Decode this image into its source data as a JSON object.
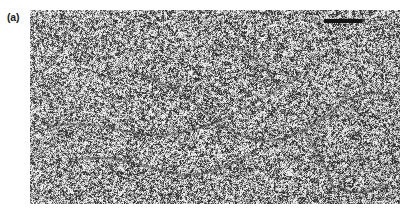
{
  "figure": {
    "kind": "electron-micrograph",
    "panel_label": "(a)",
    "caption_text": "",
    "background_color": "#ffffff"
  },
  "panel": {
    "name": "micrograph-panel",
    "x": 30,
    "y": 10,
    "width": 370,
    "height": 194,
    "mean_tone": "#c9c9c9",
    "grain_description": "fine high-contrast grayscale speckle (carbon support film)",
    "specimen_description": "faint dark branching thread-like filaments (DNA molecules) spread across the field",
    "grain": {
      "dark_color": "#2e2e2e",
      "mid_color": "#9a9a9a",
      "light_color": "#f0f0f0",
      "granule_size_px": 1.6,
      "density": 0.52,
      "seed": 20240517
    },
    "filaments": {
      "color": "#3a3a3a",
      "line_width_px": 1.4,
      "count": 11,
      "paths": [
        [
          [
            18,
            116
          ],
          [
            52,
            112
          ],
          [
            88,
            120
          ],
          [
            124,
            126
          ],
          [
            158,
            122
          ],
          [
            186,
            112
          ]
        ],
        [
          [
            186,
            112
          ],
          [
            212,
            100
          ],
          [
            236,
            86
          ],
          [
            258,
            74
          ],
          [
            272,
            62
          ]
        ],
        [
          [
            186,
            112
          ],
          [
            206,
            124
          ],
          [
            228,
            132
          ],
          [
            252,
            130
          ],
          [
            274,
            120
          ]
        ],
        [
          [
            274,
            120
          ],
          [
            296,
            108
          ],
          [
            312,
            92
          ],
          [
            320,
            74
          ]
        ],
        [
          [
            274,
            120
          ],
          [
            286,
            138
          ],
          [
            296,
            158
          ],
          [
            302,
            176
          ]
        ],
        [
          [
            98,
            60
          ],
          [
            126,
            70
          ],
          [
            150,
            82
          ],
          [
            168,
            96
          ],
          [
            180,
            108
          ]
        ],
        [
          [
            40,
            150
          ],
          [
            70,
            146
          ],
          [
            100,
            152
          ],
          [
            130,
            160
          ],
          [
            156,
            166
          ]
        ],
        [
          [
            156,
            166
          ],
          [
            184,
            162
          ],
          [
            206,
            152
          ],
          [
            226,
            140
          ]
        ],
        [
          [
            312,
            92
          ],
          [
            330,
            84
          ],
          [
            348,
            82
          ],
          [
            362,
            88
          ]
        ],
        [
          [
            206,
            36
          ],
          [
            226,
            50
          ],
          [
            240,
            64
          ],
          [
            250,
            76
          ]
        ],
        [
          [
            302,
            176
          ],
          [
            318,
            182
          ],
          [
            338,
            182
          ],
          [
            354,
            174
          ]
        ]
      ]
    }
  },
  "scale_bar": {
    "name": "scale-bar",
    "x": 324,
    "y": 19,
    "width_px": 38,
    "height_px": 4,
    "color": "#141414",
    "label": ""
  }
}
